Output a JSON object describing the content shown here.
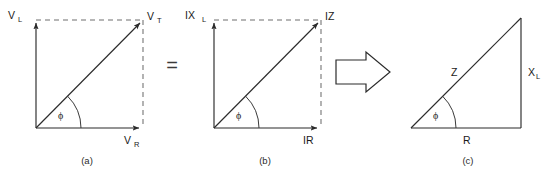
{
  "figure": {
    "background_color": "#ffffff",
    "line_color": "#2b2b2b",
    "dashed_color": "#6e6e6e",
    "operator_equals": "=",
    "panels": [
      {
        "id": "a",
        "caption": "(a)",
        "kind": "phasor-diagram",
        "angle_label": "ϕ",
        "vertical_label": {
          "base": "V",
          "sub": "L"
        },
        "horizontal_label": {
          "base": "V",
          "sub": "R"
        },
        "hypotenuse_label": {
          "base": "V",
          "sub": "T"
        },
        "geometry": {
          "origin_x": 36,
          "origin_y": 128,
          "corner_x": 143,
          "corner_y": 20,
          "arc_radius": 45
        }
      },
      {
        "id": "b",
        "caption": "(b)",
        "kind": "phasor-diagram",
        "angle_label": "ϕ",
        "vertical_label": {
          "base": "IX",
          "sub": "L"
        },
        "horizontal_label": {
          "base": "IR",
          "sub": ""
        },
        "hypotenuse_label": {
          "base": "IZ",
          "sub": ""
        },
        "geometry": {
          "origin_x": 214,
          "origin_y": 128,
          "corner_x": 321,
          "corner_y": 20,
          "arc_radius": 45
        }
      },
      {
        "id": "c",
        "caption": "(c)",
        "kind": "impedance-triangle",
        "angle_label": "ϕ",
        "vertical_label": {
          "base": "X",
          "sub": "L"
        },
        "horizontal_label": {
          "base": "R",
          "sub": ""
        },
        "hypotenuse_label": {
          "base": "Z",
          "sub": ""
        },
        "geometry": {
          "origin_x": 411,
          "origin_y": 128,
          "corner_x": 521,
          "corner_y": 18,
          "arc_radius": 45
        }
      }
    ],
    "transform_arrow": {
      "name": "implies-arrow",
      "direction": "right",
      "x": 334,
      "y": 52,
      "width": 56,
      "height": 40
    }
  }
}
